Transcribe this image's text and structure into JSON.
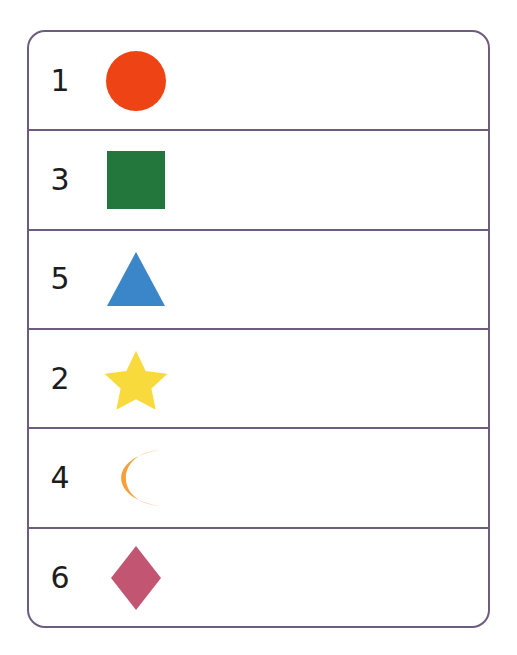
{
  "figure": {
    "kind": "shape-number-table",
    "border_color": "#6d5c80",
    "background_color": "#ffffff",
    "number_color": "#1d1d1d",
    "row_count": 6,
    "column_count": 2
  },
  "rows": [
    {
      "number": "1",
      "shape_name": "circle",
      "shape_icon": "circle-icon",
      "color": "#ee4315",
      "size": 62
    },
    {
      "number": "3",
      "shape_name": "square",
      "shape_icon": "square-icon",
      "color": "#24773c",
      "size": 62
    },
    {
      "number": "5",
      "shape_name": "triangle",
      "shape_icon": "triangle-icon",
      "color": "#3a86c8",
      "size": 62
    },
    {
      "number": "2",
      "shape_name": "star",
      "shape_icon": "star-icon",
      "color": "#f8da3c",
      "size": 62
    },
    {
      "number": "4",
      "shape_name": "crescent-moon",
      "shape_icon": "moon-icon",
      "color": "#f5a03c",
      "size": 62
    },
    {
      "number": "6",
      "shape_name": "diamond",
      "shape_icon": "diamond-icon",
      "color": "#c25672",
      "size": 62
    }
  ]
}
